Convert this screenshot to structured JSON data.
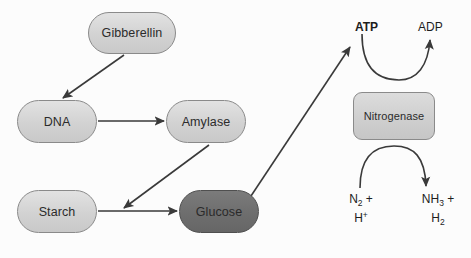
{
  "diagram": {
    "background_color": "#fcfcfc",
    "node_fill_light": "#d6d6d6",
    "node_fill_dark": "#6e6e6e",
    "stroke_color": "#3a3a3a",
    "nodes": [
      {
        "id": "gibberellin",
        "label": "Gibberellin",
        "shape": "pill",
        "fill": "light",
        "x": 88,
        "y": 12,
        "w": 88,
        "h": 42
      },
      {
        "id": "dna",
        "label": "DNA",
        "shape": "pill",
        "fill": "light",
        "x": 17,
        "y": 100,
        "w": 80,
        "h": 43
      },
      {
        "id": "amylase",
        "label": "Amylase",
        "shape": "pill",
        "fill": "light",
        "x": 166,
        "y": 100,
        "w": 80,
        "h": 43
      },
      {
        "id": "starch",
        "label": "Starch",
        "shape": "pill",
        "fill": "light",
        "x": 17,
        "y": 190,
        "w": 80,
        "h": 43
      },
      {
        "id": "glucose",
        "label": "Glucose",
        "shape": "pill",
        "fill": "dark",
        "x": 179,
        "y": 190,
        "w": 80,
        "h": 43
      },
      {
        "id": "nitrogenase",
        "label": "Nitrogenase",
        "shape": "rect",
        "fill": "mid",
        "x": 353,
        "y": 92,
        "w": 82,
        "h": 48
      }
    ],
    "labels": [
      {
        "id": "atp",
        "text": "ATP",
        "bold": true,
        "x": 355,
        "y": 20
      },
      {
        "id": "adp",
        "text": "ADP",
        "bold": false,
        "x": 418,
        "y": 20
      },
      {
        "id": "substrate",
        "text": "N2 + H+",
        "html": "N<sub>2</sub> +",
        "html2": "H<sup>+</sup>",
        "x": 338,
        "y": 192
      },
      {
        "id": "product",
        "text": "NH3 + H2",
        "html": "NH<sub>3</sub> +",
        "html2": "H<sub>2</sub>",
        "x": 411,
        "y": 192
      }
    ],
    "edges": [
      {
        "id": "gibberellin-to-dna",
        "from": "gibberellin",
        "to": "dna",
        "type": "straight"
      },
      {
        "id": "dna-to-amylase",
        "from": "dna",
        "to": "amylase",
        "type": "straight"
      },
      {
        "id": "amylase-to-starch-glucose",
        "from": "amylase",
        "to": "starch-glucose-link",
        "type": "straight"
      },
      {
        "id": "starch-to-glucose",
        "from": "starch",
        "to": "glucose",
        "type": "straight"
      },
      {
        "id": "glucose-to-atp",
        "from": "glucose",
        "to": "atp",
        "type": "straight"
      },
      {
        "id": "atp-to-adp",
        "from": "atp",
        "to": "adp",
        "type": "curve-down"
      },
      {
        "id": "substrate-to-product",
        "from": "substrate",
        "to": "product",
        "type": "curve-up"
      }
    ]
  }
}
